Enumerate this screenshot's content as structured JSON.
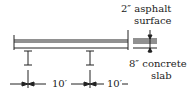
{
  "diagram": {
    "labels": {
      "asphalt_line1": "2″ asphalt",
      "asphalt_line2": "surface",
      "slab_line1": "8″ concrete",
      "slab_line2": "slab",
      "spacing1": "10′",
      "spacing2": "10′"
    },
    "elements": [
      "deck",
      "girder-1",
      "girder-2",
      "thickness-detail",
      "dimension-line"
    ],
    "colors": {
      "line": "#222222",
      "background": "#ffffff"
    }
  }
}
